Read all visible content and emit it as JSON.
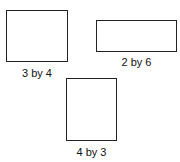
{
  "shapes": [
    {
      "id": "rect-3-by-4",
      "label": "3 by 4",
      "box": {
        "left": 6,
        "top": 10,
        "width": 62,
        "height": 52
      },
      "label_pos": {
        "left": 6,
        "top": 67,
        "width": 62
      }
    },
    {
      "id": "rect-2-by-6",
      "label": "2 by 6",
      "box": {
        "left": 96,
        "top": 20,
        "width": 81,
        "height": 32
      },
      "label_pos": {
        "left": 96,
        "top": 56,
        "width": 81
      }
    },
    {
      "id": "rect-4-by-3",
      "label": "4 by 3",
      "box": {
        "left": 66,
        "top": 78,
        "width": 51,
        "height": 63
      },
      "label_pos": {
        "left": 66,
        "top": 146,
        "width": 51
      }
    }
  ]
}
